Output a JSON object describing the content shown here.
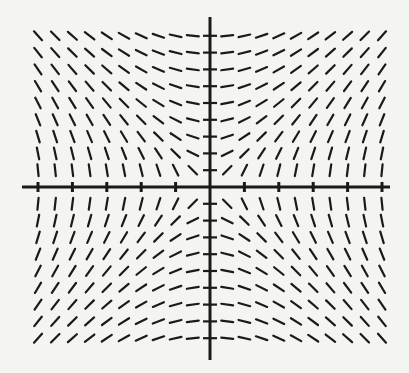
{
  "figure": {
    "type": "slope-field",
    "equation_implied": "dy/dx = x/y",
    "background_color": "#f4f4f2",
    "ink_color": "#1a1a1a",
    "origin_px": [
      210,
      187
    ],
    "x_axis": {
      "from_px": 22,
      "to_px": 390,
      "tick_count_each_side": 5
    },
    "y_axis": {
      "from_px": 17,
      "to_px": 360,
      "tick_count_each_side": 9
    },
    "grid": {
      "columns_each_side": 10,
      "rows_each_side": 9,
      "col_spacing_px": 17.2,
      "row_spacing_px": 16.8,
      "segment_length_px": 12
    }
  }
}
